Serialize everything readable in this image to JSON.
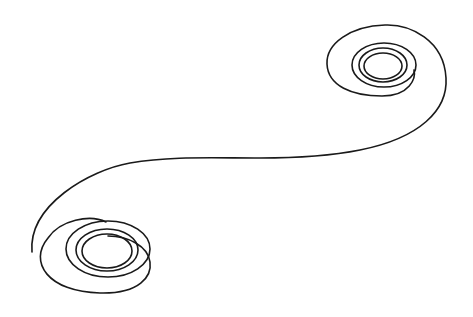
{
  "figure": {
    "title": "",
    "stroke_color": "#1a1a1a",
    "background": "#ffffff",
    "stroke_width": 1.6
  },
  "upper_spiral": {
    "center": [
      385,
      62
    ],
    "rings": [
      {
        "rx": 30,
        "ry": 20
      },
      {
        "rx": 24,
        "ry": 16
      },
      {
        "rx": 19,
        "ry": 13
      }
    ]
  },
  "lower_spiral": {
    "center": [
      106,
      251
    ],
    "rings": [
      {
        "rx": 42,
        "ry": 28
      },
      {
        "rx": 33,
        "ry": 22
      },
      {
        "rx": 26,
        "ry": 17
      }
    ]
  }
}
